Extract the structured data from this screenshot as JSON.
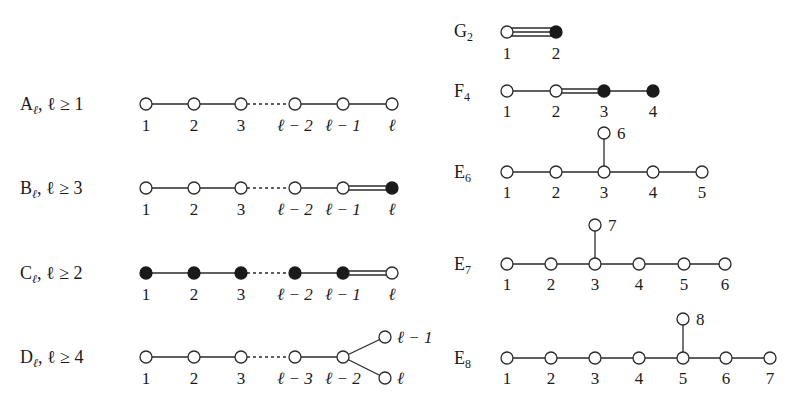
{
  "diagrams": [
    {
      "id": "A",
      "name": "A",
      "subscript": "ℓ",
      "condition": ", ℓ ≥ 1",
      "nodes": [
        {
          "label": "1",
          "filled": false
        },
        {
          "label": "2",
          "filled": false
        },
        {
          "label": "3",
          "filled": false
        },
        {
          "label": "ℓ − 2",
          "filled": false
        },
        {
          "label": "ℓ − 1",
          "filled": false
        },
        {
          "label": "ℓ",
          "filled": false
        }
      ],
      "edges": [
        "single",
        "single",
        "dashed",
        "single",
        "single"
      ]
    },
    {
      "id": "B",
      "name": "B",
      "subscript": "ℓ",
      "condition": ", ℓ ≥ 3",
      "nodes": [
        {
          "label": "1",
          "filled": false
        },
        {
          "label": "2",
          "filled": false
        },
        {
          "label": "3",
          "filled": false
        },
        {
          "label": "ℓ − 2",
          "filled": false
        },
        {
          "label": "ℓ − 1",
          "filled": false
        },
        {
          "label": "ℓ",
          "filled": true
        }
      ],
      "edges": [
        "single",
        "single",
        "dashed",
        "single",
        "double"
      ]
    },
    {
      "id": "C",
      "name": "C",
      "subscript": "ℓ",
      "condition": ", ℓ ≥ 2",
      "nodes": [
        {
          "label": "1",
          "filled": true
        },
        {
          "label": "2",
          "filled": true
        },
        {
          "label": "3",
          "filled": true
        },
        {
          "label": "ℓ − 2",
          "filled": true
        },
        {
          "label": "ℓ − 1",
          "filled": true
        },
        {
          "label": "ℓ",
          "filled": false
        }
      ],
      "edges": [
        "single",
        "single",
        "dashed",
        "single",
        "double"
      ]
    },
    {
      "id": "D",
      "name": "D",
      "subscript": "ℓ",
      "condition": ", ℓ ≥ 4",
      "nodes": [
        {
          "label": "1",
          "filled": false
        },
        {
          "label": "2",
          "filled": false
        },
        {
          "label": "3",
          "filled": false
        },
        {
          "label": "ℓ − 3",
          "filled": false
        },
        {
          "label": "ℓ − 2",
          "filled": false
        },
        {
          "label": "ℓ − 1",
          "filled": false
        },
        {
          "label": "ℓ",
          "filled": false
        }
      ],
      "edges": [
        "single",
        "single",
        "dashed",
        "single",
        "branch-up",
        "branch-down"
      ]
    },
    {
      "id": "G2",
      "name": "G",
      "subscript": "2",
      "condition": "",
      "nodes": [
        {
          "label": "1",
          "filled": false
        },
        {
          "label": "2",
          "filled": true
        }
      ],
      "edges": [
        "triple"
      ]
    },
    {
      "id": "F4",
      "name": "F",
      "subscript": "4",
      "condition": "",
      "nodes": [
        {
          "label": "1",
          "filled": false
        },
        {
          "label": "2",
          "filled": false
        },
        {
          "label": "3",
          "filled": true
        },
        {
          "label": "4",
          "filled": true
        }
      ],
      "edges": [
        "single",
        "double",
        "single"
      ]
    },
    {
      "id": "E6",
      "name": "E",
      "subscript": "6",
      "condition": "",
      "nodes": [
        {
          "label": "1"
        },
        {
          "label": "2"
        },
        {
          "label": "3"
        },
        {
          "label": "4"
        },
        {
          "label": "5"
        },
        {
          "label": "6"
        }
      ],
      "branch_at": "3"
    },
    {
      "id": "E7",
      "name": "E",
      "subscript": "7",
      "condition": "",
      "nodes": [
        {
          "label": "1"
        },
        {
          "label": "2"
        },
        {
          "label": "3"
        },
        {
          "label": "4"
        },
        {
          "label": "5"
        },
        {
          "label": "6"
        },
        {
          "label": "7"
        }
      ],
      "branch_at": "3"
    },
    {
      "id": "E8",
      "name": "E",
      "subscript": "8",
      "condition": "",
      "nodes": [
        {
          "label": "1"
        },
        {
          "label": "2"
        },
        {
          "label": "3"
        },
        {
          "label": "4"
        },
        {
          "label": "5"
        },
        {
          "label": "6"
        },
        {
          "label": "7"
        },
        {
          "label": "8"
        }
      ],
      "branch_at": "5"
    }
  ]
}
